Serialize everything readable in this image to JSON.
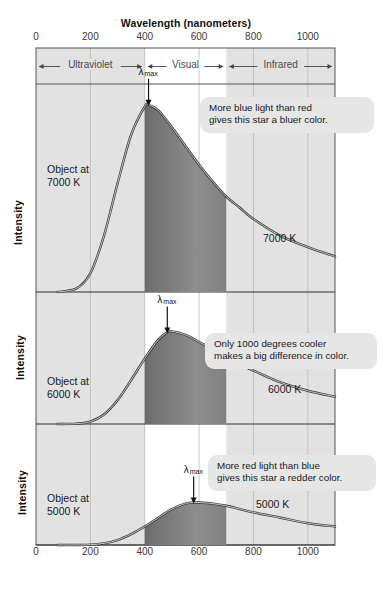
{
  "figure": {
    "top_partial_text": "",
    "x_axis_title": "Wavelength (nanometers)",
    "y_axis_label": "Intensity",
    "lambda_symbol": "λ",
    "lambda_sub": "max"
  },
  "bands": [
    {
      "name": "Ultraviolet",
      "from": 0,
      "to": 400,
      "shaded": true
    },
    {
      "name": "Visual",
      "from": 400,
      "to": 700,
      "shaded": false
    },
    {
      "name": "Infrared",
      "from": 700,
      "to": 1100,
      "shaded": true
    }
  ],
  "panels": [
    {
      "object_label": "Object at\n7000 K",
      "curve_label": "7000 K",
      "callout": "More blue light than red\ngives this star a bluer color.",
      "lambda_max_nm": 414
    },
    {
      "object_label": "Object at\n6000 K",
      "curve_label": "6000 K",
      "callout": "Only 1000 degrees cooler\nmakes a big difference in color.",
      "lambda_max_nm": 483
    },
    {
      "object_label": "Object at\n5000 K",
      "curve_label": "5000 K",
      "callout": "More red light than blue\ngives this star a redder color.",
      "lambda_max_nm": 580
    }
  ],
  "chart_data": {
    "type": "line",
    "xlabel": "Wavelength (nanometers)",
    "ylabel": "Intensity",
    "xlim": [
      0,
      1100
    ],
    "xticks": [
      0,
      200,
      400,
      600,
      800,
      1000
    ],
    "ylim": [
      0,
      1
    ],
    "yticks": [],
    "grid": true,
    "legend": "inline curve labels",
    "shaded_regions": [
      {
        "label": "Ultraviolet",
        "x_range": [
          0,
          400
        ],
        "color": "#e2e2e2"
      },
      {
        "label": "Visual",
        "x_range": [
          400,
          700
        ],
        "color": "#ffffff"
      },
      {
        "label": "Infrared",
        "x_range": [
          700,
          1100
        ],
        "color": "#e2e2e2"
      }
    ],
    "series": [
      {
        "name": "7000 K",
        "peak_nm": 414,
        "x": [
          150,
          200,
          250,
          300,
          350,
          400,
          414,
          450,
          500,
          550,
          600,
          650,
          700,
          750,
          800,
          900,
          1000,
          1100
        ],
        "values": [
          0.02,
          0.1,
          0.3,
          0.58,
          0.84,
          0.99,
          1.0,
          0.97,
          0.88,
          0.78,
          0.68,
          0.59,
          0.51,
          0.45,
          0.39,
          0.3,
          0.24,
          0.19
        ]
      },
      {
        "name": "6000 K",
        "peak_nm": 483,
        "x": [
          150,
          200,
          250,
          300,
          350,
          400,
          450,
          483,
          500,
          550,
          600,
          650,
          700,
          750,
          800,
          900,
          1000,
          1100
        ],
        "values": [
          0.003,
          0.02,
          0.08,
          0.2,
          0.37,
          0.55,
          0.71,
          0.77,
          0.78,
          0.75,
          0.69,
          0.63,
          0.56,
          0.5,
          0.45,
          0.35,
          0.28,
          0.23
        ]
      },
      {
        "name": "5000 K",
        "peak_nm": 580,
        "x": [
          150,
          200,
          250,
          300,
          350,
          400,
          450,
          500,
          550,
          580,
          600,
          650,
          700,
          750,
          800,
          900,
          1000,
          1100
        ],
        "values": [
          0.0004,
          0.003,
          0.015,
          0.045,
          0.1,
          0.17,
          0.25,
          0.33,
          0.38,
          0.39,
          0.39,
          0.38,
          0.36,
          0.33,
          0.3,
          0.25,
          0.2,
          0.17
        ]
      }
    ]
  }
}
